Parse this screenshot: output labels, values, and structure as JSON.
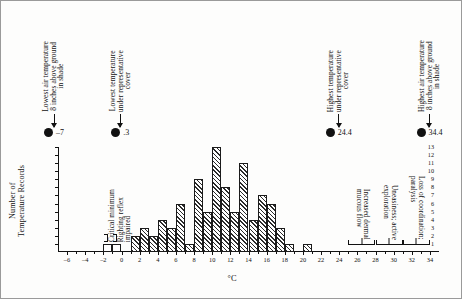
{
  "figure": {
    "xlabel": "°C",
    "ylabel": "Number of\nTemperature Records"
  },
  "markers": [
    {
      "name": "lowest-air-temperature",
      "label": "Lowest air temperature\n8 inches above ground\nin shade",
      "value": "–7",
      "x_c": -7
    },
    {
      "name": "lowest-temperature-cover",
      "label": "Lowest temperature\nunder representative\ncover",
      "value": ".3",
      "x_c": 0.3
    },
    {
      "name": "highest-temperature-cover",
      "label": "Highest temperature\nunder representative\ncover",
      "value": "24.4",
      "x_c": 24.4
    },
    {
      "name": "highest-air-temperature",
      "label": "Highest air temperature\n8 inches above ground\nin shade",
      "value": "34.4",
      "x_c": 34.4
    }
  ],
  "annotations_left": [
    {
      "name": "critical-minimum",
      "label": "Critical minimum",
      "x_from": -2,
      "x_to": -1
    },
    {
      "name": "righting-reflex-impaired",
      "label": "Righting reflex\nimpaired",
      "x_from": -1,
      "x_to": 0
    }
  ],
  "annotations_right": [
    {
      "name": "increased-dermal-mucous-flow",
      "label": "Increased dermal\nmucous flow",
      "x_from": 25,
      "x_to": 28
    },
    {
      "name": "uneasiness-active-exploration",
      "label": "Uneasiness; active\nexploration",
      "x_from": 28,
      "x_to": 31
    },
    {
      "name": "loss-of-coordination-paralysis",
      "label": "Loss of coordination;\nparalysis",
      "x_from": 31,
      "x_to": 34
    }
  ],
  "chart_data": {
    "type": "bar",
    "title": "",
    "xlabel": "°C",
    "ylabel": "Number of Temperature Records",
    "xlim": [
      -7,
      35
    ],
    "ylim": [
      0,
      13
    ],
    "grid": false,
    "legend": null,
    "xticks": [
      -6,
      -4,
      -2,
      0,
      2,
      4,
      6,
      8,
      10,
      12,
      14,
      16,
      18,
      20,
      22,
      24,
      26,
      28,
      30,
      32,
      34
    ],
    "yticks": [
      1,
      2,
      3,
      4,
      5,
      6,
      7,
      8,
      9,
      10,
      11,
      12,
      13
    ],
    "bin_width": 1,
    "bars": [
      {
        "x_from": -2,
        "x_to": -1,
        "value": 1,
        "style": "open"
      },
      {
        "x_from": -1,
        "x_to": 0,
        "value": 1,
        "style": "open"
      },
      {
        "x_from": 1,
        "x_to": 2,
        "value": 2,
        "style": "hatch"
      },
      {
        "x_from": 2,
        "x_to": 3,
        "value": 3,
        "style": "hatch"
      },
      {
        "x_from": 3,
        "x_to": 4,
        "value": 2,
        "style": "hatch"
      },
      {
        "x_from": 4,
        "x_to": 5,
        "value": 4,
        "style": "hatch"
      },
      {
        "x_from": 5,
        "x_to": 6,
        "value": 3,
        "style": "hatch"
      },
      {
        "x_from": 6,
        "x_to": 7,
        "value": 6,
        "style": "hatch"
      },
      {
        "x_from": 7,
        "x_to": 8,
        "value": 1,
        "style": "hatch"
      },
      {
        "x_from": 8,
        "x_to": 9,
        "value": 9,
        "style": "hatch"
      },
      {
        "x_from": 9,
        "x_to": 10,
        "value": 5,
        "style": "hatch"
      },
      {
        "x_from": 10,
        "x_to": 11,
        "value": 13,
        "style": "hatch"
      },
      {
        "x_from": 11,
        "x_to": 12,
        "value": 8,
        "style": "hatch"
      },
      {
        "x_from": 12,
        "x_to": 13,
        "value": 5,
        "style": "hatch"
      },
      {
        "x_from": 13,
        "x_to": 14,
        "value": 11,
        "style": "hatch"
      },
      {
        "x_from": 14,
        "x_to": 15,
        "value": 4,
        "style": "hatch"
      },
      {
        "x_from": 15,
        "x_to": 16,
        "value": 7,
        "style": "hatch"
      },
      {
        "x_from": 16,
        "x_to": 17,
        "value": 6,
        "style": "hatch"
      },
      {
        "x_from": 17,
        "x_to": 18,
        "value": 3,
        "style": "hatch"
      },
      {
        "x_from": 18,
        "x_to": 19,
        "value": 1,
        "style": "hatch"
      },
      {
        "x_from": 20,
        "x_to": 21,
        "value": 1,
        "style": "hatch"
      }
    ]
  }
}
